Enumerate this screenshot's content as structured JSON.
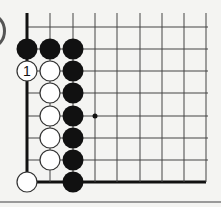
{
  "diagram": {
    "type": "go-board-fragment",
    "grid": {
      "columns_x": [
        27,
        50,
        73,
        95,
        117,
        140,
        162,
        184,
        206
      ],
      "rows_y": [
        27,
        49,
        71,
        93,
        116,
        138,
        160,
        182
      ],
      "left_edge": true,
      "bottom_edge": true,
      "top_edge": false,
      "right_edge": false
    },
    "colors": {
      "background": "#f4f4f2",
      "line": "#444444",
      "edge_line": "#111111",
      "black_stone": "#111111",
      "white_stone_fill": "#ffffff",
      "white_stone_stroke": "#333333",
      "separator": "#9a9a9a"
    },
    "stones": [
      {
        "color": "black",
        "col": 0,
        "row": 1
      },
      {
        "color": "black",
        "col": 1,
        "row": 1
      },
      {
        "color": "black",
        "col": 2,
        "row": 1
      },
      {
        "color": "white",
        "col": 0,
        "row": 2,
        "label": "1"
      },
      {
        "color": "white",
        "col": 1,
        "row": 2
      },
      {
        "color": "black",
        "col": 2,
        "row": 2
      },
      {
        "color": "white",
        "col": 1,
        "row": 3
      },
      {
        "color": "black",
        "col": 2,
        "row": 3
      },
      {
        "color": "white",
        "col": 1,
        "row": 4
      },
      {
        "color": "black",
        "col": 2,
        "row": 4
      },
      {
        "color": "white",
        "col": 1,
        "row": 5
      },
      {
        "color": "black",
        "col": 2,
        "row": 5
      },
      {
        "color": "white",
        "col": 1,
        "row": 6
      },
      {
        "color": "black",
        "col": 2,
        "row": 6
      },
      {
        "color": "white",
        "col": 0,
        "row": 7
      },
      {
        "color": "black",
        "col": 2,
        "row": 7
      }
    ],
    "markers": [
      {
        "type": "dot",
        "col": 3,
        "row": 4
      }
    ],
    "move_label": "1"
  }
}
